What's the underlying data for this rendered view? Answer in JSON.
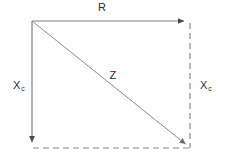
{
  "diagram": {
    "type": "impedance-vector-triangle",
    "background_color": "#ffffff",
    "line_color": "#808080",
    "text_color": "#2b2b2b",
    "labels": {
      "resistance": {
        "symbol": "R",
        "subscript": ""
      },
      "impedance": {
        "symbol": "Z",
        "subscript": ""
      },
      "reactance_left": {
        "symbol": "X",
        "subscript": "c"
      },
      "reactance_right": {
        "symbol": "X",
        "subscript": "c"
      }
    },
    "geometry": {
      "top_left": [
        32,
        21
      ],
      "top_right": [
        190,
        21
      ],
      "bottom_left": [
        32,
        148
      ],
      "bottom_right": [
        190,
        148
      ]
    },
    "edges": [
      {
        "name": "resistance-vector",
        "style": "solid",
        "arrow": "end",
        "from": "top_left",
        "to": "top_right"
      },
      {
        "name": "reactance-vector",
        "style": "solid",
        "arrow": "end",
        "from": "top_left",
        "to": "bottom_left"
      },
      {
        "name": "impedance-vector",
        "style": "solid",
        "arrow": "end",
        "from": "top_left",
        "to": "bottom_right"
      },
      {
        "name": "reactance-guide",
        "style": "dashed",
        "arrow": "none",
        "from": "top_right",
        "to": "bottom_right"
      },
      {
        "name": "resistance-guide",
        "style": "dashed",
        "arrow": "none",
        "from": "bottom_left",
        "to": "bottom_right"
      }
    ]
  }
}
